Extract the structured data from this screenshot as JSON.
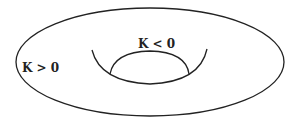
{
  "diagram": {
    "labels": {
      "outer": "K > 0",
      "inner": "K < 0"
    },
    "colors": {
      "stroke": "#222222",
      "background": "#ffffff"
    }
  }
}
